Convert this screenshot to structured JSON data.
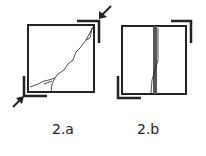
{
  "figures": [
    {
      "id": "2a",
      "label": "2.a",
      "description": "square panel with diagonal crack and shear arrows at corners"
    },
    {
      "id": "2b",
      "label": "2.b",
      "description": "square panel with vertical crack band and corner brackets"
    }
  ],
  "colors": {
    "stroke": "#222222",
    "background": "#ffffff"
  }
}
